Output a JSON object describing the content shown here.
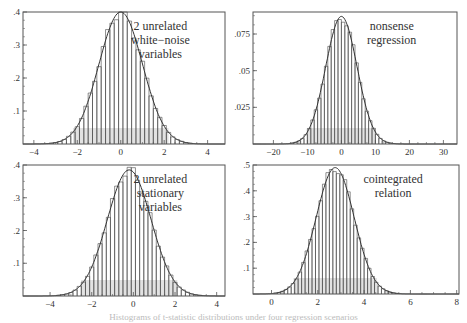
{
  "figure": {
    "caption": "Histograms of t-statistic distributions under four regression scenarios"
  },
  "chart_data": [
    {
      "type": "bar",
      "panel": "top-left",
      "title": "",
      "annotation": [
        "2 unrelated",
        "white−noise",
        "variables"
      ],
      "xlabel": "",
      "ylabel": "",
      "xlim": [
        -4.5,
        4.8
      ],
      "ylim": [
        0,
        0.4
      ],
      "xticks": [
        -4,
        -2,
        0,
        2,
        4
      ],
      "xtick_labels": [
        "−4",
        "−2",
        "0",
        "2",
        "4"
      ],
      "yticks": [
        0.1,
        0.2,
        0.3,
        0.4
      ],
      "ytick_labels": [
        ".1",
        ".2",
        ".3",
        ".4"
      ],
      "grid": false,
      "distribution": {
        "mean": 0.0,
        "sd": 1.0,
        "peak": 0.4
      },
      "bin_width": 0.2,
      "frame": {
        "x0": 23,
        "y0": 12,
        "x1": 225,
        "y1": 144
      }
    },
    {
      "type": "bar",
      "panel": "top-right",
      "title": "",
      "annotation": [
        "nonsense",
        "regression"
      ],
      "xlabel": "",
      "ylabel": "",
      "xlim": [
        -26,
        34
      ],
      "ylim": [
        0,
        0.09
      ],
      "xticks": [
        -20,
        -10,
        0,
        10,
        20,
        30
      ],
      "xtick_labels": [
        "−20",
        "−10",
        "0",
        "10",
        "20",
        "30"
      ],
      "yticks": [
        0.025,
        0.05,
        0.075
      ],
      "ytick_labels": [
        ".025",
        ".05",
        ".075"
      ],
      "grid": false,
      "distribution": {
        "mean": 0.0,
        "sd": 4.6,
        "peak": 0.087
      },
      "bin_width": 1.0,
      "frame": {
        "x0": 253,
        "y0": 12,
        "x1": 457,
        "y1": 144
      }
    },
    {
      "type": "bar",
      "panel": "bottom-left",
      "title": "",
      "annotation": [
        "2 unrelated",
        "stationary",
        "variables"
      ],
      "xlabel": "",
      "ylabel": "",
      "xlim": [
        -5.3,
        4.4
      ],
      "ylim": [
        0,
        0.4
      ],
      "xticks": [
        -4,
        -2,
        0,
        2,
        4
      ],
      "xtick_labels": [
        "−4",
        "−2",
        "0",
        "2",
        "4"
      ],
      "yticks": [
        0.1,
        0.2,
        0.3,
        0.4
      ],
      "ytick_labels": [
        ".1",
        ".2",
        ".3",
        ".4"
      ],
      "grid": false,
      "distribution": {
        "mean": -0.2,
        "sd": 1.05,
        "peak": 0.385
      },
      "bin_width": 0.2,
      "frame": {
        "x0": 23,
        "y0": 165,
        "x1": 225,
        "y1": 296
      }
    },
    {
      "type": "bar",
      "panel": "bottom-right",
      "title": "",
      "annotation": [
        "cointegrated",
        "relation"
      ],
      "xlabel": "",
      "ylabel": "",
      "xlim": [
        -0.8,
        8.1
      ],
      "ylim": [
        0,
        0.5
      ],
      "xticks": [
        0,
        2,
        4,
        6,
        8
      ],
      "xtick_labels": [
        "0",
        "2",
        "4",
        "6",
        "8"
      ],
      "yticks": [
        0.1,
        0.2,
        0.3,
        0.4,
        0.5
      ],
      "ytick_labels": [
        ".1",
        ".2",
        ".3",
        ".4",
        ".5"
      ],
      "grid": false,
      "distribution": {
        "mean": 2.75,
        "sd": 0.82,
        "peak": 0.49
      },
      "bin_width": 0.15,
      "frame": {
        "x0": 253,
        "y0": 165,
        "x1": 459,
        "y1": 294
      }
    }
  ],
  "colors": {
    "frame": "#555555",
    "bar_line": "#444444",
    "curve": "#333333",
    "shade": "#d6d6d6",
    "text": "#333333"
  }
}
